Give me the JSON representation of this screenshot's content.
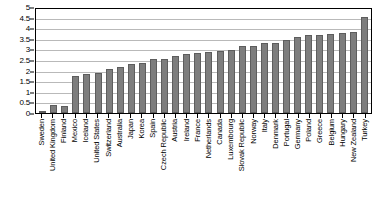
{
  "chart_data": {
    "type": "bar",
    "title": "",
    "subtitle": "",
    "xlabel": "",
    "ylabel": "",
    "ylim": [
      0,
      5
    ],
    "ytick_step": 0.5,
    "yticks": [
      "0",
      "0.5",
      "1",
      "1.5",
      "2",
      "2.5",
      "3",
      "3.5",
      "4",
      "4.5",
      "5"
    ],
    "grid": "horizontal",
    "legend": "none",
    "bar_color": "#7d7d7d",
    "bar_border_color": "#5d5d5d",
    "gridline_color": "#b9b9b9",
    "axis_color": "#000000",
    "categories": [
      "Sweden",
      "United Kingdom",
      "Finland",
      "Mexico",
      "Iceland",
      "United States",
      "Switzerland",
      "Australia",
      "Japan",
      "Korea",
      "Spain",
      "Czech Republic",
      "Austria",
      "Ireland",
      "France",
      "Netherlands",
      "Canada",
      "Luxembourg",
      "Slovak Republic",
      "Norway",
      "Italy",
      "Denmark",
      "Portugal",
      "Germany",
      "Poland",
      "Greece",
      "Belgium",
      "Hungary",
      "New Zealand",
      "Turkey"
    ],
    "values": [
      0.02,
      0.38,
      0.32,
      1.75,
      1.82,
      1.9,
      2.07,
      2.18,
      2.29,
      2.36,
      2.56,
      2.56,
      2.68,
      2.78,
      2.81,
      2.88,
      2.91,
      2.96,
      3.15,
      3.16,
      3.28,
      3.28,
      3.43,
      3.6,
      3.68,
      3.69,
      3.75,
      3.76,
      3.82,
      4.52
    ]
  }
}
